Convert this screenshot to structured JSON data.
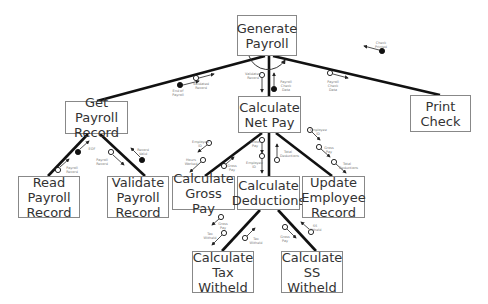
{
  "modules": [
    {
      "id": "generate",
      "label": "Generate\nPayroll",
      "x": 237,
      "y": 15,
      "w": 60,
      "h": 41
    },
    {
      "id": "getrec",
      "label": "Get Payroll\nRecord",
      "x": 65,
      "y": 101,
      "w": 63,
      "h": 33
    },
    {
      "id": "netpay",
      "label": "Calculate\nNet Pay",
      "x": 238,
      "y": 96,
      "w": 63,
      "h": 37
    },
    {
      "id": "print",
      "label": "Print\nCheck",
      "x": 410,
      "y": 95,
      "w": 61,
      "h": 37
    },
    {
      "id": "read",
      "label": "Read\nPayroll\nRecord",
      "x": 18,
      "y": 176,
      "w": 62,
      "h": 42
    },
    {
      "id": "validate",
      "label": "Validate\nPayroll\nRecord",
      "x": 107,
      "y": 176,
      "w": 62,
      "h": 42
    },
    {
      "id": "gross",
      "label": "Calculate\nGross Pay",
      "x": 172,
      "y": 176,
      "w": 63,
      "h": 34
    },
    {
      "id": "deduct",
      "label": "Calculate\nDeductions",
      "x": 237,
      "y": 176,
      "w": 63,
      "h": 34
    },
    {
      "id": "update",
      "label": "Update\nEmployee\nRecord",
      "x": 302,
      "y": 176,
      "w": 63,
      "h": 42
    },
    {
      "id": "tax",
      "label": "Calculate\nTax\nWitheld",
      "x": 192,
      "y": 251,
      "w": 62,
      "h": 42
    },
    {
      "id": "ss",
      "label": "Calculate\nSS\nWitheld",
      "x": 281,
      "y": 251,
      "w": 62,
      "h": 42
    }
  ],
  "connections": [
    {
      "from": "generate",
      "to": "getrec",
      "x1": 265,
      "y1": 56,
      "x2": 97,
      "y2": 101
    },
    {
      "from": "generate",
      "to": "netpay",
      "x1": 269,
      "y1": 56,
      "x2": 269,
      "y2": 96
    },
    {
      "from": "generate",
      "to": "print",
      "x1": 273,
      "y1": 56,
      "x2": 440,
      "y2": 95
    },
    {
      "from": "getrec",
      "to": "read",
      "x1": 88,
      "y1": 134,
      "x2": 48,
      "y2": 176
    },
    {
      "from": "getrec",
      "to": "validate",
      "x1": 100,
      "y1": 134,
      "x2": 145,
      "y2": 176
    },
    {
      "from": "netpay",
      "to": "gross",
      "x1": 262,
      "y1": 133,
      "x2": 205,
      "y2": 176
    },
    {
      "from": "netpay",
      "to": "deduct",
      "x1": 269,
      "y1": 133,
      "x2": 269,
      "y2": 176
    },
    {
      "from": "netpay",
      "to": "update",
      "x1": 276,
      "y1": 133,
      "x2": 332,
      "y2": 176
    },
    {
      "from": "deduct",
      "to": "tax",
      "x1": 260,
      "y1": 210,
      "x2": 222,
      "y2": 251
    },
    {
      "from": "deduct",
      "to": "ss",
      "x1": 278,
      "y1": 210,
      "x2": 316,
      "y2": 251
    }
  ],
  "couples": [
    {
      "type": "control",
      "label": "End of\nPayroll",
      "cx": 180,
      "cy": 85,
      "ax1": 183,
      "ay1": 85,
      "ax2": 199,
      "ay2": 81,
      "lx": 178,
      "ly": 89
    },
    {
      "type": "data",
      "label": "Validated\nRecord",
      "cx": 196,
      "cy": 78,
      "ax1": 199,
      "ay1": 78,
      "ax2": 214,
      "ay2": 74,
      "lx": 201,
      "ly": 82
    },
    {
      "type": "data",
      "label": "Validated\nRecord",
      "cx": 262,
      "cy": 75,
      "ax1": 262,
      "ay1": 78,
      "ax2": 262,
      "ay2": 92,
      "lx": 253,
      "ly": 72
    },
    {
      "type": "control",
      "label": "Payroll\nCheck Data",
      "cx": 274,
      "cy": 89,
      "ax1": 274,
      "ay1": 86,
      "ax2": 274,
      "ay2": 73,
      "lx": 286,
      "ly": 80
    },
    {
      "type": "data",
      "label": "Payroll\nCheck Data",
      "cx": 330,
      "cy": 73,
      "ax1": 333,
      "ay1": 74,
      "ax2": 348,
      "ay2": 78,
      "lx": 333,
      "ly": 80
    },
    {
      "type": "control",
      "label": "Check\nPrinted",
      "cx": 382,
      "cy": 51,
      "ax1": 379,
      "ay1": 50,
      "ax2": 364,
      "ay2": 46,
      "lx": 381,
      "ly": 41
    },
    {
      "type": "control",
      "label": "EOF",
      "cx": 78,
      "cy": 152,
      "ax1": 80,
      "ay1": 149,
      "ax2": 89,
      "ay2": 141,
      "lx": 92,
      "ly": 147
    },
    {
      "type": "data",
      "label": "Payroll\nRecord",
      "cx": 58,
      "cy": 170,
      "ax1": 60,
      "ay1": 167,
      "ax2": 69,
      "ay2": 159,
      "lx": 72,
      "ly": 166
    },
    {
      "type": "data",
      "label": "Payroll\nRecord",
      "cx": 111,
      "cy": 152,
      "ax1": 113,
      "ay1": 155,
      "ax2": 124,
      "ay2": 165,
      "lx": 102,
      "ly": 158
    },
    {
      "type": "control",
      "label": "Record\nValid",
      "cx": 142,
      "cy": 160,
      "ax1": 140,
      "ay1": 157,
      "ax2": 131,
      "ay2": 148,
      "lx": 143,
      "ly": 148
    },
    {
      "type": "data",
      "label": "Employee\nID",
      "cx": 209,
      "cy": 143,
      "ax1": 207,
      "ay1": 145,
      "ax2": 198,
      "ay2": 152,
      "lx": 200,
      "ly": 140
    },
    {
      "type": "data",
      "label": "Hours\nWorked",
      "cx": 203,
      "cy": 160,
      "ax1": 201,
      "ay1": 162,
      "ax2": 190,
      "ay2": 172,
      "lx": 191,
      "ly": 158
    },
    {
      "type": "data",
      "label": "Gross\nPay",
      "cx": 224,
      "cy": 166,
      "ax1": 226,
      "ay1": 164,
      "ax2": 234,
      "ay2": 157,
      "lx": 232,
      "ly": 164
    },
    {
      "type": "data",
      "label": "Gross\nPay",
      "cx": 262,
      "cy": 140,
      "ax1": 262,
      "ay1": 143,
      "ax2": 262,
      "ay2": 153,
      "lx": 255,
      "ly": 140
    },
    {
      "type": "data",
      "label": "Employee\nID",
      "cx": 262,
      "cy": 156,
      "ax1": 262,
      "ay1": 159,
      "ax2": 262,
      "ay2": 173,
      "lx": 254,
      "ly": 161
    },
    {
      "type": "data",
      "label": "Total\nDeductions",
      "cx": 277,
      "cy": 160,
      "ax1": 277,
      "ay1": 157,
      "ax2": 277,
      "ay2": 144,
      "lx": 288,
      "ly": 150
    },
    {
      "type": "data",
      "label": "Employee\nID",
      "cx": 310,
      "cy": 130,
      "ax1": 312,
      "ay1": 132,
      "ax2": 320,
      "ay2": 140,
      "lx": 318,
      "ly": 128
    },
    {
      "type": "data",
      "label": "Gross\nPay",
      "cx": 319,
      "cy": 147,
      "ax1": 321,
      "ay1": 149,
      "ax2": 330,
      "ay2": 157,
      "lx": 329,
      "ly": 146
    },
    {
      "type": "data",
      "label": "Total\nDeductions",
      "cx": 334,
      "cy": 162,
      "ax1": 336,
      "ay1": 164,
      "ax2": 346,
      "ay2": 173,
      "lx": 347,
      "ly": 162
    },
    {
      "type": "data",
      "label": "Gross\nPay",
      "cx": 221,
      "cy": 217,
      "ax1": 219,
      "ay1": 219,
      "ax2": 212,
      "ay2": 225,
      "lx": 223,
      "ly": 222
    },
    {
      "type": "data",
      "label": "Tax\nWitheld",
      "cx": 224,
      "cy": 233,
      "ax1": 222,
      "ay1": 235,
      "ax2": 212,
      "ay2": 245,
      "lx": 210,
      "ly": 232
    },
    {
      "type": "data",
      "label": "Tax\nWitheld",
      "cx": 245,
      "cy": 238,
      "ax1": 247,
      "ay1": 236,
      "ax2": 255,
      "ay2": 228,
      "lx": 256,
      "ly": 237
    },
    {
      "type": "data",
      "label": "Gross\nPay",
      "cx": 285,
      "cy": 227,
      "ax1": 287,
      "ay1": 229,
      "ax2": 296,
      "ay2": 238,
      "lx": 285,
      "ly": 235
    },
    {
      "type": "data",
      "label": "SS\nWitheld",
      "cx": 311,
      "cy": 232,
      "ax1": 309,
      "ay1": 229,
      "ax2": 301,
      "ay2": 222,
      "lx": 315,
      "ly": 224
    }
  ],
  "iteration_arc": {
    "cx": 269,
    "cy": 56,
    "r": 20
  }
}
